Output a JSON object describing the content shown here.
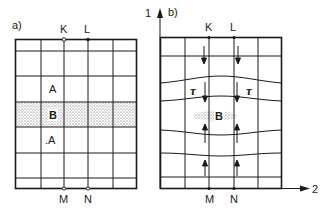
{
  "panel_a": {
    "label": "a)",
    "top_points": [
      "K",
      "L"
    ],
    "bottom_points": [
      "M",
      "N"
    ],
    "region_upper": "A",
    "region_center": "B",
    "region_lower": ".A"
  },
  "panel_b": {
    "label": "b)",
    "top_points": [
      "K",
      "L"
    ],
    "bottom_points": [
      "M",
      "N"
    ],
    "region_center": "B",
    "shear_left": "τ",
    "shear_right": "τ",
    "axis_vertical": "1",
    "axis_horizontal": "2"
  },
  "colors": {
    "ink": "#1a1a1a",
    "background": "#ffffff"
  }
}
